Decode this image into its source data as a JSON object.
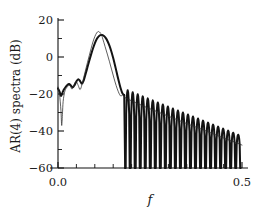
{
  "chart_data": {
    "type": "line",
    "title": "",
    "xlabel": "f",
    "ylabel": "AR(4) spectra  (dB)",
    "xlim": [
      0.0,
      0.5
    ],
    "ylim": [
      -60,
      20
    ],
    "grid": false,
    "legend": "none",
    "xticks": [
      0.0,
      0.5
    ],
    "xtick_labels": [
      "0.0",
      "0.5"
    ],
    "xminor_ticks": [
      0.05,
      0.1,
      0.15,
      0.2,
      0.25,
      0.3,
      0.35,
      0.4,
      0.45
    ],
    "yticks": [
      20,
      0,
      -20,
      -40,
      -60
    ],
    "ytick_labels": [
      "20",
      "0",
      "−20",
      "−40",
      "−60"
    ],
    "yminor_ticks": [
      10,
      -10,
      -30,
      -50
    ],
    "series": [
      {
        "name": "AR(4) estimate (thick)",
        "style": "solid-thick",
        "color": "#131313",
        "x": [
          0.0,
          0.004,
          0.008,
          0.012,
          0.016,
          0.02,
          0.025,
          0.03,
          0.035,
          0.04,
          0.045,
          0.05,
          0.055,
          0.06,
          0.065,
          0.07,
          0.075,
          0.08,
          0.085,
          0.09,
          0.095,
          0.1,
          0.105,
          0.11,
          0.115,
          0.12,
          0.125,
          0.13,
          0.135,
          0.14,
          0.145,
          0.15,
          0.155,
          0.16,
          0.165,
          0.17,
          0.175,
          0.18
        ],
        "y": [
          -17.0,
          -18.6,
          -21.0,
          -19.4,
          -17.6,
          -16.4,
          -15.2,
          -14.6,
          -15.4,
          -16.4,
          -15.2,
          -13.2,
          -12.0,
          -13.0,
          -14.4,
          -12.6,
          -9.2,
          -5.6,
          -2.0,
          1.4,
          4.6,
          7.4,
          9.6,
          11.0,
          11.8,
          11.9,
          11.4,
          10.2,
          8.4,
          6.0,
          3.0,
          -0.6,
          -4.6,
          -8.8,
          -13.0,
          -16.8,
          -19.6,
          -20.6
        ]
      },
      {
        "name": "AR(4) estimate sidelobes (thick)",
        "style": "solid-thick-oscillating",
        "color": "#131313",
        "comment": "rapid nulls to -60 dB between lobe peaks, peak envelope decays linearly",
        "lobe_count": 23,
        "lobe_start_f": 0.1825,
        "lobe_spacing_f": 0.01365,
        "lobe_peak_start_db": -18.0,
        "lobe_peak_end_db": -42.0,
        "lobe_null_db": -60.0
      },
      {
        "name": "True / periodogram spectrum (thin)",
        "style": "solid-thin",
        "color": "#2a2a2a",
        "x": [
          0.0,
          0.004,
          0.008,
          0.01,
          0.012,
          0.014,
          0.018,
          0.022,
          0.026,
          0.03,
          0.034,
          0.038,
          0.042,
          0.046,
          0.05,
          0.055,
          0.06,
          0.065,
          0.07,
          0.075,
          0.08,
          0.085,
          0.09,
          0.095,
          0.1,
          0.105,
          0.11,
          0.115,
          0.118,
          0.122,
          0.128,
          0.134,
          0.14,
          0.146,
          0.152,
          0.158,
          0.164,
          0.17,
          0.176,
          0.182
        ],
        "y": [
          -16.2,
          -20.0,
          -29.0,
          -37.0,
          -31.0,
          -24.0,
          -19.0,
          -17.0,
          -16.0,
          -15.0,
          -16.0,
          -17.4,
          -16.0,
          -14.0,
          -13.4,
          -15.4,
          -17.6,
          -15.0,
          -11.0,
          -7.0,
          -3.0,
          0.8,
          4.6,
          8.2,
          11.0,
          13.0,
          13.8,
          13.0,
          12.2,
          9.6,
          5.6,
          1.6,
          -2.6,
          -7.0,
          -11.4,
          -15.4,
          -18.8,
          -21.0,
          -20.6,
          -22.0
        ]
      },
      {
        "name": "True spectrum decay through sidelobes (thin)",
        "style": "solid-thin-descending",
        "color": "#2a2a2a",
        "x": [
          0.182,
          0.21,
          0.24,
          0.27,
          0.3,
          0.33,
          0.36,
          0.39,
          0.42,
          0.45,
          0.48,
          0.5
        ],
        "y": [
          -22.0,
          -24.6,
          -27.2,
          -29.6,
          -32.0,
          -34.4,
          -36.8,
          -39.0,
          -41.4,
          -43.8,
          -46.0,
          -47.6
        ]
      }
    ]
  },
  "axes": {
    "ylabel_text": "AR(4) spectra  (dB)",
    "xlabel_text": "f"
  }
}
